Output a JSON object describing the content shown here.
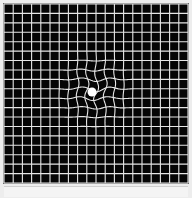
{
  "figure": {
    "type": "amsler-grid",
    "grid": {
      "columns": 20,
      "rows": 19,
      "background_color": "#050505",
      "line_color": "#e6e6e6",
      "x0": 4,
      "y0": 4,
      "x1": 188,
      "y1": 183
    },
    "fixation_dot": {
      "cx": 92,
      "cy": 92,
      "r": 4.5,
      "color": "#ffffff"
    },
    "distortion_region": {
      "cx": 95,
      "cy": 90,
      "radius": 42
    },
    "page_background": "#ededed"
  }
}
